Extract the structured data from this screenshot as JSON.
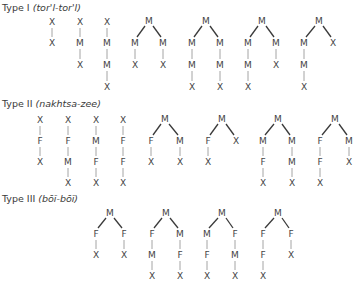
{
  "legend": {
    "X": "ego / alter",
    "M": "male link",
    "F": "female link"
  },
  "sections": [
    {
      "label": "Type I",
      "pronunciation": "(tor'l-tor'l)",
      "heading_y": 11,
      "rows_y": [
        22,
        43,
        65,
        87
      ],
      "chains": [
        {
          "x": 52,
          "nodes": [
            "X",
            "X"
          ]
        },
        {
          "x": 80,
          "nodes": [
            "X",
            "M",
            "X"
          ]
        },
        {
          "x": 107,
          "nodes": [
            "X",
            "M",
            "M",
            "X"
          ]
        }
      ],
      "trees": [
        {
          "root_x": 149,
          "left": {
            "x": 135,
            "nodes": [
              "M",
              "X"
            ]
          },
          "right": {
            "x": 163,
            "nodes": [
              "M",
              "X"
            ]
          }
        },
        {
          "root_x": 206,
          "left": {
            "x": 192,
            "nodes": [
              "M",
              "M",
              "X"
            ]
          },
          "right": {
            "x": 220,
            "nodes": [
              "M",
              "M",
              "X"
            ]
          }
        },
        {
          "root_x": 262,
          "left": {
            "x": 248,
            "nodes": [
              "M",
              "M",
              "X"
            ]
          },
          "right": {
            "x": 276,
            "nodes": [
              "M",
              "X"
            ]
          }
        },
        {
          "root_x": 319,
          "left": {
            "x": 304,
            "nodes": [
              "M",
              "M",
              "X"
            ]
          },
          "right": {
            "x": 333,
            "nodes": [
              "X"
            ]
          }
        }
      ]
    },
    {
      "label": "Type II",
      "pronunciation": "(nakhtsa-zee)",
      "heading_y": 107,
      "rows_y": [
        120,
        141,
        162,
        183
      ],
      "chains": [
        {
          "x": 40,
          "nodes": [
            "X",
            "F",
            "X"
          ]
        },
        {
          "x": 68,
          "nodes": [
            "X",
            "F",
            "M",
            "X"
          ]
        },
        {
          "x": 96,
          "nodes": [
            "X",
            "M",
            "F",
            "X"
          ]
        },
        {
          "x": 123,
          "nodes": [
            "X",
            "F",
            "F",
            "X"
          ]
        }
      ],
      "trees": [
        {
          "root_x": 165,
          "left": {
            "x": 151,
            "nodes": [
              "F",
              "X"
            ]
          },
          "right": {
            "x": 180,
            "nodes": [
              "M",
              "X"
            ]
          }
        },
        {
          "root_x": 222,
          "left": {
            "x": 208,
            "nodes": [
              "F",
              "X"
            ]
          },
          "right": {
            "x": 236,
            "nodes": [
              "X"
            ]
          }
        },
        {
          "root_x": 278,
          "left": {
            "x": 263,
            "nodes": [
              "M",
              "F",
              "X"
            ]
          },
          "right": {
            "x": 292,
            "nodes": [
              "M",
              "M",
              "X"
            ]
          }
        },
        {
          "root_x": 335,
          "left": {
            "x": 320,
            "nodes": [
              "F",
              "F",
              "X"
            ]
          },
          "right": {
            "x": 349,
            "nodes": [
              "M",
              "X"
            ]
          }
        }
      ]
    },
    {
      "label": "Type III",
      "pronunciation": "(bōĭ-bōĭ)",
      "heading_y": 202,
      "rows_y": [
        214,
        234,
        255,
        276
      ],
      "chains": [],
      "trees": [
        {
          "root_x": 110,
          "left": {
            "x": 96,
            "nodes": [
              "F",
              "X"
            ]
          },
          "right": {
            "x": 124,
            "nodes": [
              "F",
              "X"
            ]
          }
        },
        {
          "root_x": 166,
          "left": {
            "x": 152,
            "nodes": [
              "F",
              "M",
              "X"
            ]
          },
          "right": {
            "x": 180,
            "nodes": [
              "M",
              "F",
              "X"
            ]
          }
        },
        {
          "root_x": 222,
          "left": {
            "x": 207,
            "nodes": [
              "M",
              "F",
              "X"
            ]
          },
          "right": {
            "x": 235,
            "nodes": [
              "F",
              "M",
              "X"
            ]
          }
        },
        {
          "root_x": 278,
          "left": {
            "x": 263,
            "nodes": [
              "F",
              "F",
              "X"
            ]
          },
          "right": {
            "x": 291,
            "nodes": [
              "F",
              "X"
            ]
          }
        }
      ]
    }
  ]
}
